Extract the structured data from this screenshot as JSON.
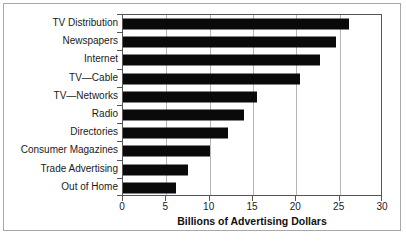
{
  "chart_data": {
    "type": "bar",
    "orientation": "horizontal",
    "title": "",
    "xlabel": "Billions of Advertising Dollars",
    "ylabel": "",
    "xlim": [
      0,
      30
    ],
    "xticks": [
      "0",
      "5",
      "10",
      "15",
      "20",
      "25",
      "30"
    ],
    "grid": "vertical",
    "legend": "none",
    "bar_color": "#0a0a0a",
    "gridline_color": "#b5b5b5",
    "axis_color": "#555555",
    "categories": [
      "TV Distribution",
      "Newspapers",
      "Internet",
      "TV—Cable",
      "TV—Networks",
      "Radio",
      "Directories",
      "Consumer Magazines",
      "Trade Advertising",
      "Out of Home"
    ],
    "values": [
      26.1,
      24.6,
      22.7,
      20.4,
      15.5,
      14.0,
      12.1,
      10.0,
      7.5,
      6.1
    ]
  }
}
